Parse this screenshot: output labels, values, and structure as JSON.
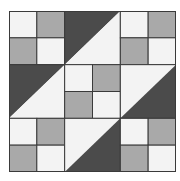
{
  "quilt": {
    "grid": 6,
    "colors": {
      "light": "#f3f3f3",
      "medium": "#a9a9a9",
      "dark": "#4b4b4b",
      "line": "#3a3a3a"
    },
    "blocks": [
      {
        "row": 0,
        "col": 0,
        "type": "four-patch",
        "cells": [
          "light",
          "medium",
          "medium",
          "light"
        ]
      },
      {
        "row": 0,
        "col": 1,
        "type": "half-square",
        "upper_left": "dark",
        "lower_right": "light"
      },
      {
        "row": 0,
        "col": 2,
        "type": "four-patch",
        "cells": [
          "light",
          "medium",
          "medium",
          "light"
        ]
      },
      {
        "row": 1,
        "col": 0,
        "type": "half-square",
        "upper_left": "dark",
        "lower_right": "light"
      },
      {
        "row": 1,
        "col": 1,
        "type": "four-patch",
        "cells": [
          "light",
          "medium",
          "medium",
          "light"
        ]
      },
      {
        "row": 1,
        "col": 2,
        "type": "half-square",
        "upper_left": "light",
        "lower_right": "dark"
      },
      {
        "row": 2,
        "col": 0,
        "type": "four-patch",
        "cells": [
          "light",
          "medium",
          "medium",
          "light"
        ]
      },
      {
        "row": 2,
        "col": 1,
        "type": "half-square",
        "upper_left": "light",
        "lower_right": "dark"
      },
      {
        "row": 2,
        "col": 2,
        "type": "four-patch",
        "cells": [
          "light",
          "medium",
          "medium",
          "light"
        ]
      }
    ]
  }
}
